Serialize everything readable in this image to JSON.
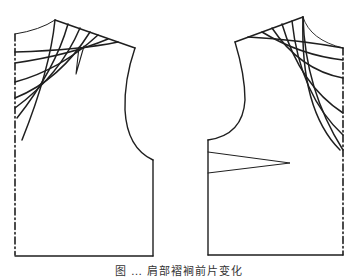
{
  "figure": {
    "caption": "图 … 肩部褶裥前片变化",
    "caption_visible": "partially cropped at bottom edge",
    "stroke_color": "#1f1f1f",
    "background_color": "#ffffff"
  },
  "pieces": [
    {
      "id": "left-front-piece",
      "description": "Front bodice pattern with radiating shoulder pleat lines to center front",
      "center_line_style": "dash-dot",
      "radiating_lines": 7,
      "has_small_shoulder_dart": true
    },
    {
      "id": "right-front-piece",
      "description": "Mirrored front bodice pattern with radiating shoulder pleat lines and side bust dart",
      "center_line_style": "dash-dot",
      "radiating_lines": 7,
      "has_side_dart": true
    }
  ]
}
